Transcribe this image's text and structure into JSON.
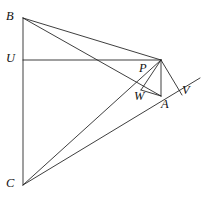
{
  "figure": {
    "type": "geometry-diagram",
    "stroke_color": "#1c1c1c",
    "background_color": "#ffffff",
    "canvas": {
      "width": 206,
      "height": 197
    },
    "points": [
      {
        "id": "B",
        "label": "B",
        "x": 23,
        "y": 18,
        "label_x": 6,
        "label_y": 10,
        "labeled": true
      },
      {
        "id": "U",
        "label": "U",
        "x": 23,
        "y": 60,
        "label_x": 6,
        "label_y": 52,
        "labeled": true
      },
      {
        "id": "C",
        "label": "C",
        "x": 23,
        "y": 185,
        "label_x": 6,
        "label_y": 177,
        "labeled": true
      },
      {
        "id": "T",
        "label": "",
        "x": 161,
        "y": 60,
        "label_x": 0,
        "label_y": 0,
        "labeled": false
      },
      {
        "id": "P",
        "label": "P",
        "x": 146,
        "y": 74,
        "label_x": 139,
        "label_y": 62,
        "labeled": true
      },
      {
        "id": "W",
        "label": "W",
        "x": 143,
        "y": 88,
        "label_x": 134,
        "label_y": 90,
        "labeled": true
      },
      {
        "id": "A",
        "label": "A",
        "x": 161,
        "y": 96,
        "label_x": 161,
        "label_y": 98,
        "labeled": true
      },
      {
        "id": "V",
        "label": "V",
        "x": 186,
        "y": 84,
        "label_x": 182,
        "label_y": 84,
        "labeled": true
      }
    ],
    "segments": [
      {
        "id": "B-C",
        "from": "B",
        "to": "C",
        "x1": 23,
        "y1": 18,
        "x2": 23,
        "y2": 185
      },
      {
        "id": "U-T",
        "from": "U",
        "to": "T",
        "x1": 23,
        "y1": 60,
        "x2": 161,
        "y2": 60
      },
      {
        "id": "B-T",
        "from": "B",
        "to": "T",
        "x1": 23,
        "y1": 18,
        "x2": 161,
        "y2": 60
      },
      {
        "id": "B-A",
        "from": "B",
        "to": "A",
        "x1": 23,
        "y1": 18,
        "x2": 161,
        "y2": 96
      },
      {
        "id": "C-T",
        "from": "C",
        "to": "T",
        "x1": 23,
        "y1": 185,
        "x2": 161,
        "y2": 60
      },
      {
        "id": "C-V",
        "from": "C",
        "to": "V",
        "x1": 23,
        "y1": 185,
        "x2": 200,
        "y2": 78
      },
      {
        "id": "T-A",
        "from": "T",
        "to": "A",
        "x1": 161,
        "y1": 60,
        "x2": 161,
        "y2": 96
      },
      {
        "id": "T-W",
        "from": "T",
        "to": "W",
        "x1": 161,
        "y1": 60,
        "x2": 141,
        "y2": 90
      },
      {
        "id": "T-V",
        "from": "T",
        "to": "V",
        "x1": 161,
        "y1": 60,
        "x2": 182,
        "y2": 95
      },
      {
        "id": "W-A",
        "from": "W",
        "to": "A",
        "x1": 141,
        "y1": 90,
        "x2": 161,
        "y2": 96
      }
    ]
  }
}
